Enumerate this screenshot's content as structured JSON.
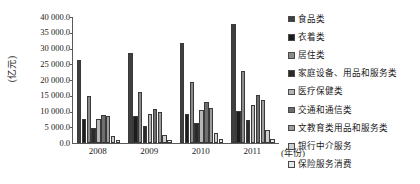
{
  "chart_data": {
    "type": "bar",
    "title": "",
    "subtitle": "",
    "xlabel": "(年份)",
    "ylabel": "(亿元)",
    "categories": [
      "2008",
      "2009",
      "2010",
      "2011"
    ],
    "ylim": [
      0,
      40000
    ],
    "ytick_labels": [
      "40 000.0",
      "35 000.0",
      "30 000.0",
      "25 000.0",
      "20 000.0",
      "15 000.0",
      "10 000.0",
      "5 000.0",
      "0.0"
    ],
    "ytick_values": [
      40000,
      35000,
      30000,
      25000,
      20000,
      15000,
      10000,
      5000,
      0
    ],
    "grid": false,
    "legend_position": "right",
    "series": [
      {
        "name": "食品类",
        "color": "#3f3f3f",
        "values": [
          26500,
          28600,
          31900,
          37800
        ]
      },
      {
        "name": "衣着类",
        "color": "#1c1c1c",
        "values": [
          7500,
          8500,
          9200,
          10100
        ]
      },
      {
        "name": "居住类",
        "color": "#8a8a8a",
        "values": [
          14800,
          16300,
          19500,
          22800
        ]
      },
      {
        "name": "家庭设备、用品和服务类",
        "color": "#2a2a2a",
        "values": [
          4800,
          5500,
          6300,
          7300
        ]
      },
      {
        "name": "医疗保健类",
        "color": "#b5b5b5",
        "values": [
          7600,
          9100,
          10600,
          12200
        ]
      },
      {
        "name": "交通和通信类",
        "color": "#6e6e6e",
        "values": [
          9000,
          10900,
          13000,
          15100
        ]
      },
      {
        "name": "文教育类用品和服务类",
        "color": "#9c9c9c",
        "values": [
          8700,
          9700,
          11200,
          13800
        ]
      },
      {
        "name": "银行中介服务",
        "color": "#cfcfcf",
        "values": [
          2300,
          2700,
          3300,
          4100
        ]
      },
      {
        "name": "保险服务消费",
        "color": "#e8e8e8",
        "values": [
          800,
          950,
          1150,
          1400
        ]
      }
    ]
  },
  "axis": {
    "y_title": "(亿元)",
    "x_title": "(年份)"
  }
}
